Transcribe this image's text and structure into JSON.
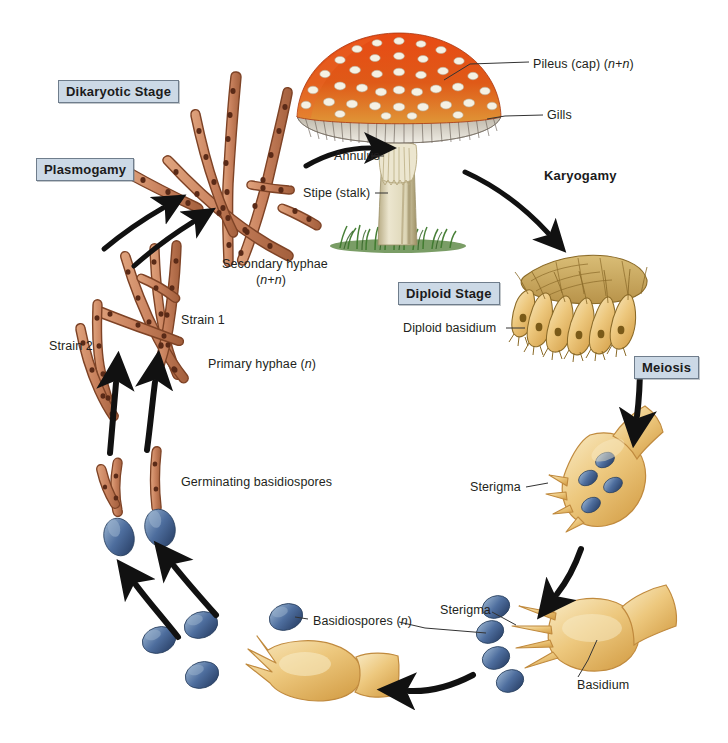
{
  "diagram": {
    "background": "#ffffff"
  },
  "stage_labels": [
    {
      "id": "dikaryotic",
      "text": "Dikaryotic Stage",
      "boxed": true,
      "x": 58,
      "y": 80
    },
    {
      "id": "plasmogamy",
      "text": "Plasmogamy",
      "boxed": true,
      "x": 36,
      "y": 158
    },
    {
      "id": "karyogamy",
      "text": "Karyogamy",
      "boxed": false,
      "x": 544,
      "y": 168
    },
    {
      "id": "diploid",
      "text": "Diploid Stage",
      "boxed": true,
      "x": 398,
      "y": 282
    },
    {
      "id": "meiosis",
      "text": "Meiosis",
      "boxed": true,
      "x": 634,
      "y": 356
    }
  ],
  "part_labels": [
    {
      "id": "pileus",
      "text": "Pileus (cap) (n+n)",
      "italic_tail": "(n+n)",
      "x": 533,
      "y": 57,
      "align": "left"
    },
    {
      "id": "gills",
      "text": "Gills",
      "x": 547,
      "y": 110,
      "align": "left"
    },
    {
      "id": "annulus",
      "text": "Annulus",
      "x": 334,
      "y": 150,
      "align": "left"
    },
    {
      "id": "stipe",
      "text": "Stipe (stalk)",
      "x": 307,
      "y": 188,
      "align": "left"
    },
    {
      "id": "secondary",
      "text": "Secondary hyphae",
      "x": 225,
      "y": 259,
      "align": "left"
    },
    {
      "id": "secondary2",
      "text": "(n+n)",
      "x": 256,
      "y": 274,
      "align": "left"
    },
    {
      "id": "strain1",
      "text": "Strain 1",
      "x": 180,
      "y": 315,
      "align": "left"
    },
    {
      "id": "strain2",
      "text": "Strain 2",
      "x": 49,
      "y": 340,
      "align": "left"
    },
    {
      "id": "primary",
      "text": "Primary hyphae (n)",
      "x": 208,
      "y": 358,
      "align": "left"
    },
    {
      "id": "germinating",
      "text": "Germinating basidiospores",
      "x": 182,
      "y": 477,
      "align": "left"
    },
    {
      "id": "basidiospores",
      "text": "Basidiospores (n)",
      "x": 312,
      "y": 616,
      "align": "left"
    },
    {
      "id": "diploid_bas",
      "text": "Diploid basidium",
      "x": 404,
      "y": 322,
      "align": "left"
    },
    {
      "id": "sterigma_mid",
      "text": "Sterigma",
      "x": 470,
      "y": 481,
      "align": "left"
    },
    {
      "id": "sterigma_bot",
      "text": "Sterigma",
      "x": 440,
      "y": 605,
      "align": "left"
    },
    {
      "id": "basidium_bot",
      "text": "Basidium",
      "x": 577,
      "y": 680,
      "align": "left"
    }
  ],
  "colors": {
    "hypha_fill": "#c9825e",
    "hypha_stroke": "#7e4326",
    "hypha_nucleus": "#5a2a17",
    "spore_fill": "#4a6b9a",
    "spore_dark": "#2e4872",
    "spore_light": "#8aa6c8",
    "basidium_fill": "#e8c178",
    "basidium_light": "#f6e3b4",
    "basidium_stroke": "#c08a3e",
    "hymenium_fill": "#c9a75a",
    "hymenium_stroke": "#8a6a28",
    "cap_red": "#de4516",
    "cap_orange": "#e8862a",
    "cap_wart": "#f3efe2",
    "gill_gray": "#d8d4cb",
    "gill_line": "#6b6258",
    "stipe_fill": "#ded8c0",
    "stipe_shade": "#b9ad86",
    "grass": "#3f7a2e",
    "arrow": "#111111",
    "leader": "#333333",
    "box_fill": "#ccd9e6",
    "box_border": "#6f7d8c"
  },
  "flow_arrows": [
    {
      "id": "arrow-hyphae-to-mushroom",
      "from": "secondary hyphae",
      "to": "mushroom fruiting body"
    },
    {
      "id": "arrow-karyogamy",
      "from": "mushroom",
      "to": "diploid basidium"
    },
    {
      "id": "arrow-meiosis",
      "from": "diploid basidium",
      "to": "meiotic basidium"
    },
    {
      "id": "arrow-basidium-down",
      "from": "meiotic basidium",
      "to": "basidium with spores"
    },
    {
      "id": "arrow-spore-release",
      "from": "basidium",
      "to": "released basidiospores"
    },
    {
      "id": "arrow-germinate-left",
      "from": "basidiospores",
      "to": "germinating basidiospores"
    },
    {
      "id": "arrow-germinate-right",
      "from": "basidiospores",
      "to": "germinating basidiospores"
    },
    {
      "id": "arrow-primary-1",
      "from": "germinating spore",
      "to": "primary hyphae strain 2"
    },
    {
      "id": "arrow-primary-2",
      "from": "germinating spore",
      "to": "primary hyphae strain 1"
    },
    {
      "id": "arrow-plasmogamy-1",
      "from": "primary hyphae",
      "to": "secondary hyphae"
    },
    {
      "id": "arrow-plasmogamy-2",
      "from": "primary hyphae",
      "to": "secondary hyphae"
    }
  ]
}
